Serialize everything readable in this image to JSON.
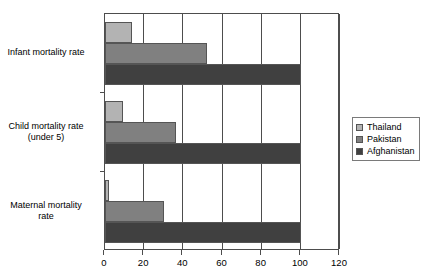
{
  "chart_data": {
    "type": "bar",
    "orientation": "horizontal",
    "title": "",
    "xlabel": "",
    "ylabel": "",
    "xlim": [
      0,
      120
    ],
    "xticks": [
      0,
      20,
      40,
      60,
      80,
      100,
      120
    ],
    "xtick_labels": [
      "0",
      "20",
      "40",
      "60",
      "80",
      "100",
      "120"
    ],
    "grid": "vertical",
    "legend_position": "right",
    "categories": [
      "Infant mortality rate",
      "Child mortality rate (under 5)",
      "Maternal mortality rate"
    ],
    "category_lines": [
      [
        "Infant mortality rate"
      ],
      [
        "Child mortality rate",
        "(under 5)"
      ],
      [
        "Maternal mortality",
        "rate"
      ]
    ],
    "series": [
      {
        "name": "Thailand",
        "color": "#b3b3b3",
        "values": [
          14,
          9,
          2
        ]
      },
      {
        "name": "Pakistan",
        "color": "#808080",
        "values": [
          52,
          36,
          30
        ]
      },
      {
        "name": "Afghanistan",
        "color": "#404040",
        "values": [
          100,
          100,
          100
        ]
      }
    ]
  },
  "legend": {
    "items": [
      {
        "label": "Thailand",
        "color": "#b3b3b3"
      },
      {
        "label": "Pakistan",
        "color": "#808080"
      },
      {
        "label": "Afghanistan",
        "color": "#404040"
      }
    ]
  },
  "colors": {
    "thailand": "#b3b3b3",
    "pakistan": "#808080",
    "afghanistan": "#404040",
    "axis": "#4d4d4d",
    "background": "#ffffff"
  }
}
